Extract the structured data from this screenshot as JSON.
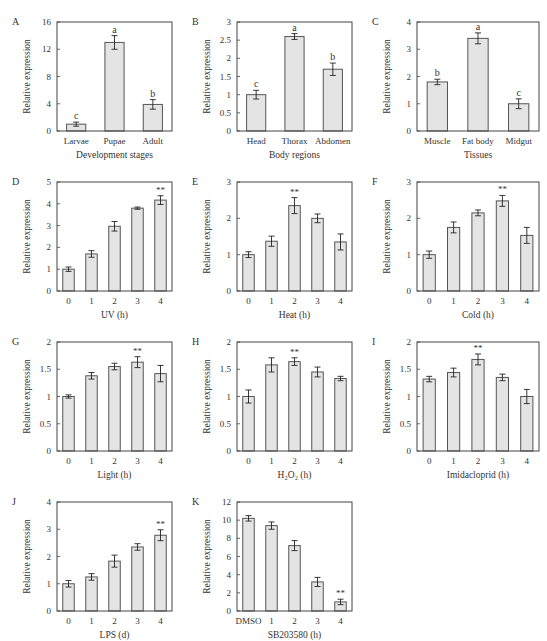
{
  "figure": {
    "bar_fill": "#e4e4e4",
    "bar_stroke": "#555555",
    "axis_color": "#444444"
  },
  "chart_data": [
    {
      "panel": "A",
      "type": "bar",
      "categories": [
        "Larvae",
        "Pupae",
        "Adult"
      ],
      "values": [
        1.0,
        13.0,
        3.9
      ],
      "errors": [
        0.3,
        1.0,
        0.7
      ],
      "annotations": [
        "c",
        "a",
        "b"
      ],
      "xlabel": "Development stages",
      "ylabel": "Relative expression",
      "ylim": [
        0,
        16
      ],
      "yticks": [
        "0",
        "4",
        "8",
        "12",
        "16"
      ]
    },
    {
      "panel": "B",
      "type": "bar",
      "categories": [
        "Head",
        "Thorax",
        "Abdomen"
      ],
      "values": [
        1.0,
        2.6,
        1.7
      ],
      "errors": [
        0.12,
        0.08,
        0.17
      ],
      "annotations": [
        "c",
        "a",
        "b"
      ],
      "xlabel": "Body regions",
      "ylabel": "Relative expression",
      "ylim": [
        0,
        3
      ],
      "yticks": [
        "0",
        "0.5",
        "1",
        "1.5",
        "2",
        "2.5",
        "3"
      ]
    },
    {
      "panel": "C",
      "type": "bar",
      "categories": [
        "Muscle",
        "Fat body",
        "Midgut"
      ],
      "values": [
        1.8,
        3.4,
        1.0
      ],
      "errors": [
        0.1,
        0.2,
        0.18
      ],
      "annotations": [
        "b",
        "a",
        "c"
      ],
      "xlabel": "Tissues",
      "ylabel": "Relative expression",
      "ylim": [
        0,
        4
      ],
      "yticks": [
        "0",
        "1",
        "2",
        "3",
        "4"
      ]
    },
    {
      "panel": "D",
      "type": "bar",
      "categories": [
        "0",
        "1",
        "2",
        "3",
        "4"
      ],
      "values": [
        1.0,
        1.7,
        2.97,
        3.8,
        4.17
      ],
      "errors": [
        0.1,
        0.15,
        0.22,
        0.05,
        0.2
      ],
      "annotations": [
        "",
        "",
        "",
        "",
        "**"
      ],
      "xlabel": "UV (h)",
      "ylabel": "Relative expression",
      "ylim": [
        0,
        5
      ],
      "yticks": [
        "0",
        "1",
        "2",
        "3",
        "4",
        "5"
      ]
    },
    {
      "panel": "E",
      "type": "bar",
      "categories": [
        "0",
        "1",
        "2",
        "3",
        "4"
      ],
      "values": [
        1.0,
        1.37,
        2.35,
        2.0,
        1.35
      ],
      "errors": [
        0.08,
        0.14,
        0.22,
        0.12,
        0.22
      ],
      "annotations": [
        "",
        "",
        "**",
        "",
        ""
      ],
      "xlabel": "Heat (h)",
      "ylabel": "Relative expression",
      "ylim": [
        0,
        3
      ],
      "yticks": [
        "0",
        "1",
        "2",
        "3"
      ]
    },
    {
      "panel": "F",
      "type": "bar",
      "categories": [
        "0",
        "1",
        "2",
        "3",
        "4"
      ],
      "values": [
        1.0,
        1.75,
        2.15,
        2.48,
        1.53
      ],
      "errors": [
        0.1,
        0.15,
        0.08,
        0.15,
        0.22
      ],
      "annotations": [
        "",
        "",
        "",
        "**",
        ""
      ],
      "xlabel": "Cold (h)",
      "ylabel": "Relative expression",
      "ylim": [
        0,
        3
      ],
      "yticks": [
        "0",
        "1",
        "2",
        "3"
      ]
    },
    {
      "panel": "G",
      "type": "bar",
      "categories": [
        "0",
        "1",
        "2",
        "3",
        "4"
      ],
      "values": [
        1.0,
        1.38,
        1.55,
        1.63,
        1.42
      ],
      "errors": [
        0.03,
        0.06,
        0.06,
        0.1,
        0.15
      ],
      "annotations": [
        "",
        "",
        "",
        "**",
        ""
      ],
      "xlabel": "Light (h)",
      "ylabel": "Relative expression",
      "ylim": [
        0,
        2
      ],
      "yticks": [
        "0",
        "0.5",
        "1",
        "1.5",
        "2"
      ]
    },
    {
      "panel": "H",
      "type": "bar",
      "categories": [
        "0",
        "1",
        "2",
        "3",
        "4"
      ],
      "values": [
        1.0,
        1.58,
        1.64,
        1.45,
        1.33
      ],
      "errors": [
        0.12,
        0.13,
        0.07,
        0.09,
        0.04
      ],
      "annotations": [
        "",
        "",
        "**",
        "",
        ""
      ],
      "xlabel": "H₂O₂ (h)",
      "ylabel": "Relative expression",
      "ylim": [
        0,
        2
      ],
      "yticks": [
        "0",
        "0.5",
        "1",
        "1.5",
        "2"
      ]
    },
    {
      "panel": "I",
      "type": "bar",
      "categories": [
        "0",
        "1",
        "2",
        "3",
        "4"
      ],
      "values": [
        1.32,
        1.44,
        1.68,
        1.35,
        1.0
      ],
      "errors": [
        0.05,
        0.08,
        0.1,
        0.06,
        0.13
      ],
      "annotations": [
        "",
        "",
        "**",
        "",
        ""
      ],
      "xlabel": "Imidacloprid (h)",
      "ylabel": "Relative expression",
      "ylim": [
        0,
        2
      ],
      "yticks": [
        "0",
        "0.5",
        "1",
        "1.5",
        "2"
      ]
    },
    {
      "panel": "J",
      "type": "bar",
      "categories": [
        "0",
        "1",
        "2",
        "3",
        "4"
      ],
      "values": [
        1.0,
        1.25,
        1.83,
        2.35,
        2.78
      ],
      "errors": [
        0.12,
        0.12,
        0.22,
        0.12,
        0.2
      ],
      "annotations": [
        "",
        "",
        "",
        "",
        "**"
      ],
      "xlabel": "LPS (d)",
      "ylabel": "Relative expression",
      "ylim": [
        0,
        4
      ],
      "yticks": [
        "0",
        "1",
        "2",
        "3",
        "4"
      ]
    },
    {
      "panel": "K",
      "type": "bar",
      "categories": [
        "DMSO",
        "1",
        "2",
        "3",
        "4"
      ],
      "values": [
        10.2,
        9.4,
        7.2,
        3.2,
        1.0
      ],
      "errors": [
        0.3,
        0.4,
        0.55,
        0.5,
        0.3
      ],
      "annotations": [
        "",
        "",
        "",
        "",
        "**"
      ],
      "xlabel": "SB203580 (h)",
      "ylabel": "Relative expression",
      "ylim": [
        0,
        12
      ],
      "yticks": [
        "0",
        "2",
        "4",
        "6",
        "8",
        "10",
        "12"
      ]
    }
  ]
}
